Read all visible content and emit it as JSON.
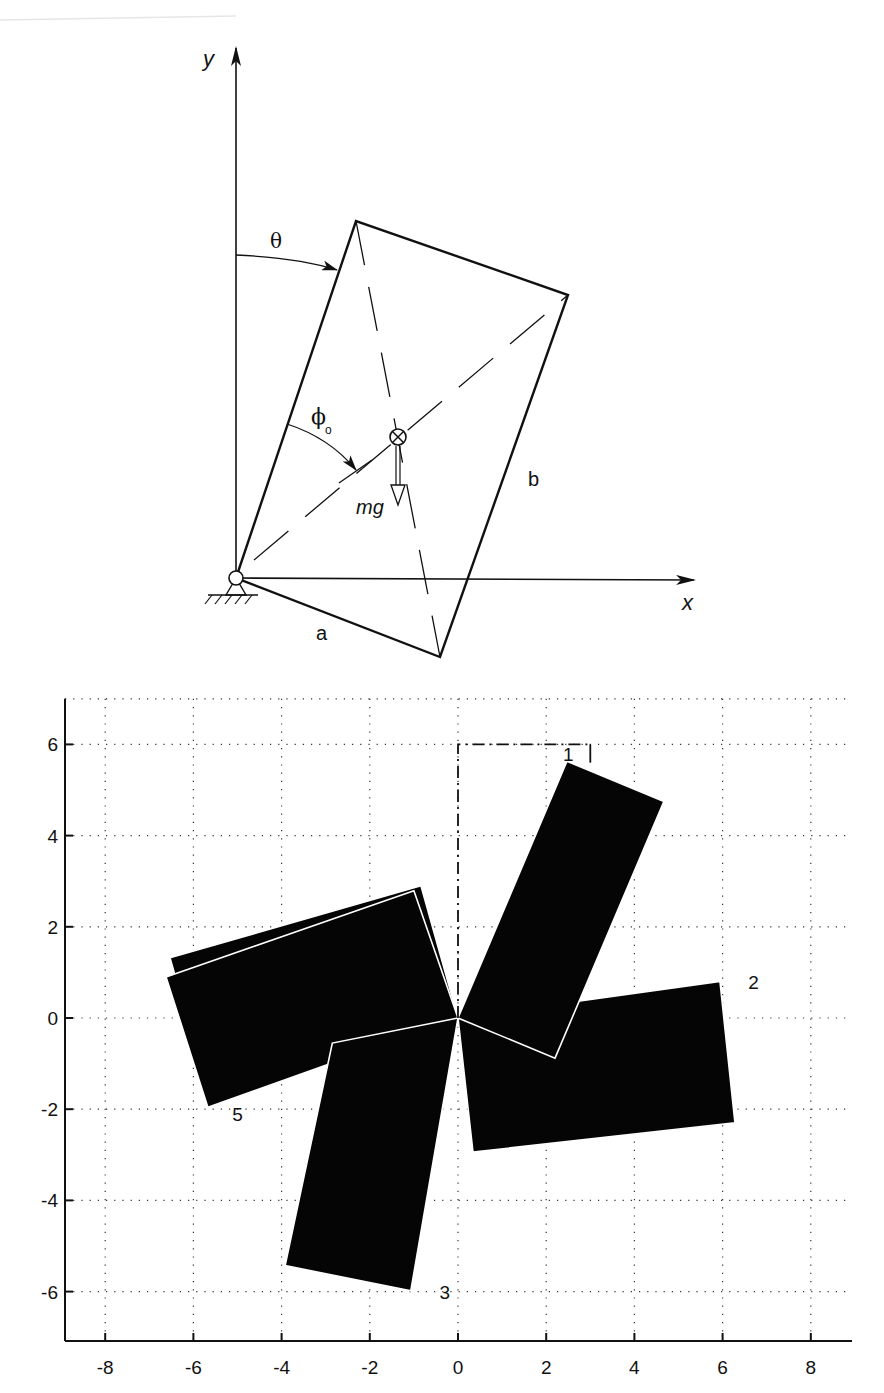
{
  "diagram": {
    "axes": {
      "x_label": "x",
      "y_label": "y"
    },
    "angle_labels": {
      "theta": "θ",
      "phi": "ϕ",
      "phi_subscript": "o"
    },
    "force_label": "mg",
    "side_labels": {
      "a": "a",
      "b": "b"
    },
    "icons": [
      "pin-support-icon",
      "center-of-mass-icon",
      "gravity-arrow-icon"
    ]
  },
  "chart_data": {
    "type": "scatter",
    "title": "",
    "xlabel": "",
    "ylabel": "",
    "xlim": [
      -9,
      9
    ],
    "ylim": [
      -7,
      7
    ],
    "grid": true,
    "x_ticks": [
      "-8",
      "-6",
      "-4",
      "-2",
      "0",
      "2",
      "4",
      "6",
      "8"
    ],
    "y_ticks": [
      "6",
      "4",
      "2",
      "0",
      "-2",
      "-4",
      "-6"
    ],
    "initial_outline": {
      "style": "dash-dot",
      "corners": [
        [
          0,
          0
        ],
        [
          0,
          6
        ],
        [
          3,
          6
        ],
        [
          3,
          0
        ]
      ]
    },
    "rectangles": [
      {
        "label": "1",
        "corners": [
          [
            0,
            0
          ],
          [
            2.47,
            5.63
          ],
          [
            4.67,
            4.75
          ],
          [
            2.2,
            -0.88
          ]
        ],
        "label_pos": [
          2.5,
          5.8
        ]
      },
      {
        "label": "2",
        "corners": [
          [
            0,
            0
          ],
          [
            5.94,
            0.8
          ],
          [
            6.28,
            -2.3
          ],
          [
            0.34,
            -2.94
          ]
        ],
        "label_pos": [
          6.7,
          0.8
        ]
      },
      {
        "label": "3",
        "corners": [
          [
            0,
            0
          ],
          [
            -2.85,
            -0.55
          ],
          [
            -3.92,
            -5.43
          ],
          [
            -1.07,
            -5.98
          ]
        ],
        "label_pos": [
          -0.3,
          -6.0
        ]
      },
      {
        "label": "4",
        "corners": [
          [
            0,
            0
          ],
          [
            -0.84,
            2.9
          ],
          [
            -6.53,
            1.32
          ],
          [
            -5.69,
            -1.58
          ]
        ],
        "label_pos": null
      },
      {
        "label": "5",
        "corners": [
          [
            0,
            0
          ],
          [
            -1.0,
            2.79
          ],
          [
            -6.62,
            0.9
          ],
          [
            -5.67,
            -1.96
          ]
        ],
        "label_pos": [
          -5.0,
          -2.1
        ]
      }
    ],
    "visible_labels": [
      "1",
      "2",
      "3",
      "5"
    ]
  }
}
